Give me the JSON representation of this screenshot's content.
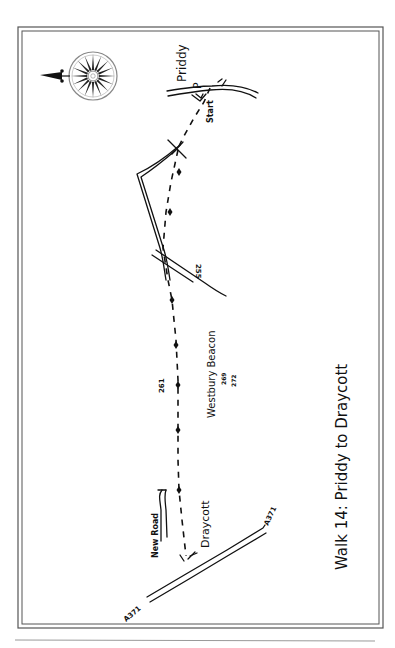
{
  "title": "Walk 14: Priddy to Draycott",
  "places": {
    "start_village": "Priddy",
    "parking": "P",
    "start": "Start",
    "end_village": "Draycott",
    "hill": "Westbury Beacon",
    "side_road": "New Road",
    "main_road_north": "A371",
    "main_road_south": "A371"
  },
  "spot_heights": [
    "255",
    "261",
    "269",
    "272"
  ],
  "compass": {
    "direction": "north",
    "icon": "compass-rose-icon"
  },
  "colors": {
    "ink": "#111111",
    "border": "#555555",
    "paper": "#ffffff"
  }
}
